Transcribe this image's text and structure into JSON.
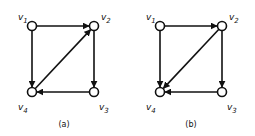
{
  "graphs": [
    {
      "caption": "(a)",
      "nodes": [
        {
          "id": "v1",
          "name": "v",
          "sub": "1",
          "x": 32,
          "y": 26,
          "lx": 18,
          "ly": 20
        },
        {
          "id": "v2",
          "name": "v",
          "sub": "2",
          "x": 94,
          "y": 26,
          "lx": 101,
          "ly": 20
        },
        {
          "id": "v3",
          "name": "v",
          "sub": "3",
          "x": 94,
          "y": 92,
          "lx": 99,
          "ly": 110
        },
        {
          "id": "v4",
          "name": "v",
          "sub": "4",
          "x": 32,
          "y": 92,
          "lx": 18,
          "ly": 110
        }
      ],
      "edges": [
        {
          "from": "v1",
          "to": "v2"
        },
        {
          "from": "v1",
          "to": "v4"
        },
        {
          "from": "v2",
          "to": "v3"
        },
        {
          "from": "v3",
          "to": "v4"
        },
        {
          "from": "v4",
          "to": "v2"
        }
      ],
      "caption_x": 64,
      "caption_y": 127
    },
    {
      "caption": "(b)",
      "nodes": [
        {
          "id": "v1",
          "name": "v",
          "sub": "1",
          "x": 160,
          "y": 26,
          "lx": 146,
          "ly": 20
        },
        {
          "id": "v2",
          "name": "v",
          "sub": "2",
          "x": 222,
          "y": 26,
          "lx": 229,
          "ly": 20
        },
        {
          "id": "v3",
          "name": "v",
          "sub": "3",
          "x": 222,
          "y": 92,
          "lx": 227,
          "ly": 110
        },
        {
          "id": "v4",
          "name": "v",
          "sub": "4",
          "x": 160,
          "y": 92,
          "lx": 146,
          "ly": 110
        }
      ],
      "edges": [
        {
          "from": "v1",
          "to": "v2"
        },
        {
          "from": "v1",
          "to": "v4"
        },
        {
          "from": "v2",
          "to": "v3"
        },
        {
          "from": "v3",
          "to": "v4"
        },
        {
          "from": "v2",
          "to": "v4"
        }
      ],
      "caption_x": 191,
      "caption_y": 127
    }
  ]
}
